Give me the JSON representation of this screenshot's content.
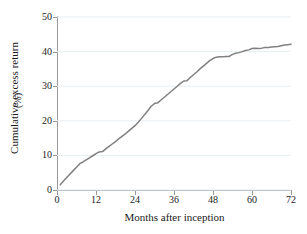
{
  "figure": {
    "top_artifact_text": "",
    "background_color": "#ffffff"
  },
  "chart_data": {
    "type": "line",
    "title": "",
    "xlabel": "Months after inception",
    "ylabel": "Cumulative excess return",
    "ylabel_unit": "(%)",
    "xlim": [
      0,
      72
    ],
    "ylim": [
      0,
      50
    ],
    "xticks": [
      0,
      12,
      24,
      36,
      48,
      60,
      72
    ],
    "xtick_labels": [
      "0",
      "12",
      "24",
      "36",
      "48",
      "60",
      "72"
    ],
    "yticks": [
      0,
      10,
      20,
      30,
      40,
      50
    ],
    "ytick_labels": [
      "0",
      "10",
      "20",
      "30",
      "40",
      "50"
    ],
    "grid": "horizontal",
    "grid_color": "#e8eef2",
    "legend": "none",
    "series": [
      {
        "name": "Cumulative excess return",
        "color": "#808080",
        "line_width": 1.5,
        "x": [
          1,
          2,
          3,
          4,
          5,
          6,
          7,
          8,
          9,
          10,
          11,
          12,
          13,
          14,
          15,
          16,
          17,
          18,
          19,
          20,
          21,
          22,
          23,
          24,
          25,
          26,
          27,
          28,
          29,
          30,
          31,
          32,
          33,
          34,
          35,
          36,
          37,
          38,
          39,
          40,
          41,
          42,
          43,
          44,
          45,
          46,
          47,
          48,
          49,
          50,
          51,
          52,
          53,
          54,
          55,
          56,
          57,
          58,
          59,
          60,
          61,
          62,
          63,
          64,
          65,
          66,
          67,
          68,
          69,
          70,
          71,
          72
        ],
        "values": [
          1.5,
          2.6,
          3.6,
          4.6,
          5.6,
          6.6,
          7.6,
          8.1,
          8.7,
          9.3,
          9.9,
          10.5,
          11.0,
          11.1,
          11.9,
          12.6,
          13.3,
          14.0,
          14.8,
          15.5,
          16.2,
          17.0,
          17.8,
          18.6,
          19.6,
          20.7,
          21.8,
          23.0,
          24.2,
          25.0,
          25.2,
          26.0,
          26.8,
          27.6,
          28.4,
          29.2,
          30.0,
          30.8,
          31.5,
          31.6,
          32.5,
          33.3,
          34.1,
          35.0,
          35.8,
          36.6,
          37.4,
          38.0,
          38.4,
          38.5,
          38.5,
          38.6,
          38.6,
          39.2,
          39.5,
          39.7,
          40.0,
          40.3,
          40.5,
          40.9,
          41.0,
          40.9,
          41.0,
          41.2,
          41.2,
          41.3,
          41.4,
          41.5,
          41.7,
          41.9,
          42.0,
          42.1
        ]
      }
    ]
  }
}
